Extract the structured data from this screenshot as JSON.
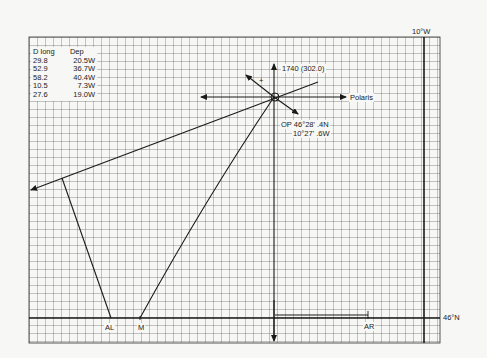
{
  "table": {
    "headers": [
      "D long",
      "Dep"
    ],
    "rows": [
      [
        "29.8",
        "20.5W"
      ],
      [
        "52.9",
        "36.7W"
      ],
      [
        "58.2",
        "40.4W"
      ],
      [
        "10.5",
        "7.3W"
      ],
      [
        "27.6",
        "19.0W"
      ]
    ]
  },
  "labels": {
    "meridian": "10°W",
    "parallel": "46°N",
    "azimuth": "1740 (302.0)",
    "polaris": "Polaris",
    "op_lat": "OP 46°28' .4N",
    "op_lon": "10°27' .6W",
    "plus": "+",
    "al": "AL",
    "m": "M",
    "ar": "AR"
  },
  "colors": {
    "background": "#f7f7f5",
    "grid": "#555555",
    "ink": "#1a1a1a"
  }
}
